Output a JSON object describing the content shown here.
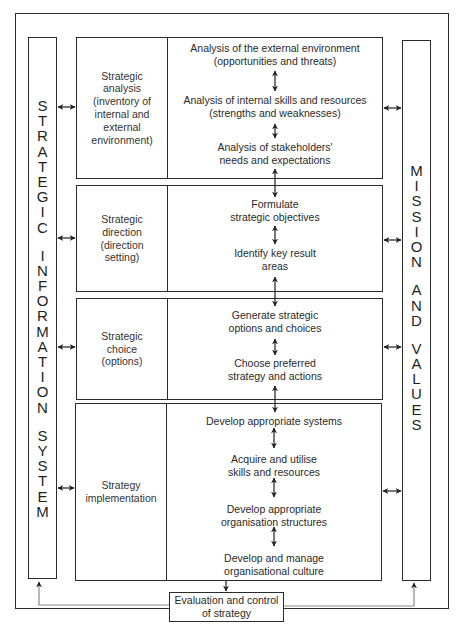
{
  "diagram": {
    "left_column": {
      "letters_word1": [
        "S",
        "T",
        "R",
        "A",
        "T",
        "E",
        "G",
        "I",
        "C"
      ],
      "letters_word2": [
        "I",
        "N",
        "F",
        "O",
        "R",
        "M",
        "A",
        "T",
        "I",
        "O",
        "N"
      ],
      "letters_word3": [
        "S",
        "Y",
        "S",
        "T",
        "E",
        "M"
      ],
      "full_text": "STRATEGIC INFORMATION SYSTEM"
    },
    "right_column": {
      "letters_word1": [
        "M",
        "I",
        "S",
        "S",
        "I",
        "O",
        "N"
      ],
      "letters_word2": [
        "A",
        "N",
        "D"
      ],
      "letters_word3": [
        "V",
        "A",
        "L",
        "U",
        "E",
        "S"
      ],
      "full_text": "MISSION AND VALUES"
    },
    "stages": [
      {
        "label": "Strategic analysis (inventory of internal and external environment)",
        "label_lines": [
          "Strategic",
          "analysis",
          "(inventory of",
          "internal and",
          "external",
          "environment)"
        ],
        "items": [
          {
            "lines": [
              "Analysis of the external environment",
              "(opportunities and threats)"
            ]
          },
          {
            "lines": [
              "Analysis of internal skills and resources",
              "(strengths and weaknesses)"
            ]
          },
          {
            "lines": [
              "Analysis of stakeholders'",
              "needs and expectations"
            ]
          }
        ]
      },
      {
        "label": "Strategic direction (direction setting)",
        "label_lines": [
          "Strategic",
          "direction",
          "(direction",
          "setting)"
        ],
        "items": [
          {
            "lines": [
              "Formulate",
              "strategic objectives"
            ]
          },
          {
            "lines": [
              "Identify key result",
              "areas"
            ]
          }
        ]
      },
      {
        "label": "Strategic choice (options)",
        "label_lines": [
          "Strategic",
          "choice",
          "(options)"
        ],
        "items": [
          {
            "lines": [
              "Generate strategic",
              "options and choices"
            ]
          },
          {
            "lines": [
              "Choose preferred",
              "strategy and actions"
            ]
          }
        ]
      },
      {
        "label": "Strategy implementation",
        "label_lines": [
          "Strategy",
          "implementation"
        ],
        "items": [
          {
            "lines": [
              "Develop appropriate systems"
            ]
          },
          {
            "lines": [
              "Acquire and utilise",
              "skills and resources"
            ]
          },
          {
            "lines": [
              "Develop appropriate",
              "organisation structures"
            ]
          },
          {
            "lines": [
              "Develop and manage",
              "organisational culture"
            ]
          }
        ]
      }
    ],
    "evaluation": {
      "lines": [
        "Evaluation and control",
        "of strategy"
      ]
    },
    "colors": {
      "line": "#2b2b2b",
      "text": "#2a2a2a",
      "feedback_line": "#8a8a8a",
      "background": "#ffffff"
    }
  }
}
